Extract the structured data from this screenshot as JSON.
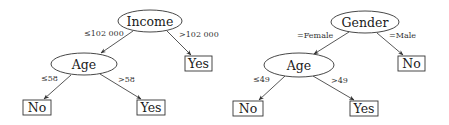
{
  "trees": [
    {
      "root": {
        "label": "Income",
        "cx": 150,
        "cy": 21,
        "rx": 32,
        "ry": 11
      },
      "inner": {
        "label": "Age",
        "cx": 84,
        "cy": 64,
        "rx": 33,
        "ry": 11
      },
      "leaves": [
        {
          "label": "Yes",
          "x": 185,
          "y": 56,
          "w": 27,
          "h": 15
        },
        {
          "label": "No",
          "x": 23,
          "y": 100,
          "w": 28,
          "h": 15
        },
        {
          "label": "Yes",
          "x": 137,
          "y": 100,
          "w": 28,
          "h": 15
        }
      ],
      "edges": [
        {
          "label": "≤102 000",
          "from": [
            133,
            31
          ],
          "to": [
            101,
            53
          ],
          "lx": 84,
          "ly": 36
        },
        {
          "label": ">102 000",
          "from": [
            167,
            31
          ],
          "to": [
            191,
            55
          ],
          "lx": 180,
          "ly": 37
        },
        {
          "label": "≤58",
          "from": [
            71,
            75
          ],
          "to": [
            44,
            99
          ],
          "lx": 41,
          "ly": 81
        },
        {
          "label": ">58",
          "from": [
            100,
            74
          ],
          "to": [
            141,
            99
          ],
          "lx": 118,
          "ly": 82
        }
      ]
    },
    {
      "root": {
        "label": "Gender",
        "cx": 365,
        "cy": 22,
        "rx": 34,
        "ry": 11
      },
      "inner": {
        "label": "Age",
        "cx": 299,
        "cy": 65,
        "rx": 35,
        "ry": 12
      },
      "leaves": [
        {
          "label": "No",
          "x": 398,
          "y": 56,
          "w": 27,
          "h": 15
        },
        {
          "label": "No",
          "x": 233,
          "y": 101,
          "w": 30,
          "h": 15
        },
        {
          "label": "Yes",
          "x": 350,
          "y": 101,
          "w": 28,
          "h": 15
        }
      ],
      "edges": [
        {
          "label": "=Female",
          "from": [
            349,
            32
          ],
          "to": [
            314,
            54
          ],
          "lx": 297,
          "ly": 38
        },
        {
          "label": "=Male",
          "from": [
            377,
            33
          ],
          "to": [
            403,
            55
          ],
          "lx": 389,
          "ly": 38
        },
        {
          "label": "≤49",
          "from": [
            285,
            76
          ],
          "to": [
            259,
            100
          ],
          "lx": 254,
          "ly": 82
        },
        {
          "label": ">49",
          "from": [
            313,
            76
          ],
          "to": [
            354,
            100
          ],
          "lx": 331,
          "ly": 83
        }
      ]
    }
  ],
  "tree_labels": {
    "t0_root": "Income",
    "t0_inner": "Age",
    "t0_leaf0": "Yes",
    "t0_leaf1": "No",
    "t0_leaf2": "Yes",
    "t0_e0": "≤102 000",
    "t0_e1": ">102 000",
    "t0_e2": "≤58",
    "t0_e3": ">58",
    "t1_root": "Gender",
    "t1_inner": "Age",
    "t1_leaf0": "No",
    "t1_leaf1": "No",
    "t1_leaf2": "Yes",
    "t1_e0": "=Female",
    "t1_e1": "=Male",
    "t1_e2": "≤49",
    "t1_e3": ">49"
  },
  "colors": {
    "stroke": "#333333",
    "text": "#1a1a1a",
    "background": "#ffffff"
  }
}
